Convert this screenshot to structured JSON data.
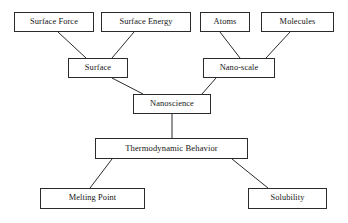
{
  "diagram": {
    "type": "hierarchy-tree",
    "background_color": "#ffffff",
    "box_border_color": "#2b2b2b",
    "text_color": "#161616",
    "connector_color": "#2b2b2b",
    "nodes": [
      {
        "id": "surface_force",
        "label": "Surface Force",
        "level": 1,
        "x": 14,
        "y": 12,
        "w": 80,
        "h": 20
      },
      {
        "id": "surface_energy",
        "label": "Surface Energy",
        "level": 1,
        "x": 101,
        "y": 12,
        "w": 90,
        "h": 20
      },
      {
        "id": "atoms",
        "label": "Atoms",
        "level": 1,
        "x": 200,
        "y": 12,
        "w": 50,
        "h": 20
      },
      {
        "id": "molecules",
        "label": "Molecules",
        "level": 1,
        "x": 261,
        "y": 12,
        "w": 73,
        "h": 20
      },
      {
        "id": "surface",
        "label": "Surface",
        "level": 2,
        "x": 68,
        "y": 58,
        "w": 60,
        "h": 20
      },
      {
        "id": "nano_scale",
        "label": "Nano-scale",
        "level": 2,
        "x": 203,
        "y": 58,
        "w": 72,
        "h": 20
      },
      {
        "id": "nanoscience",
        "label": "Nanoscience",
        "level": 3,
        "x": 133,
        "y": 94,
        "w": 78,
        "h": 20
      },
      {
        "id": "thermodynamic",
        "label": "Thermodynamic Behavior",
        "level": 4,
        "x": 95,
        "y": 138,
        "w": 153,
        "h": 21
      },
      {
        "id": "melting_point",
        "label": "Melting Point",
        "level": 5,
        "x": 40,
        "y": 188,
        "w": 105,
        "h": 21
      },
      {
        "id": "solubility",
        "label": "Solubility",
        "level": 5,
        "x": 248,
        "y": 188,
        "w": 79,
        "h": 21
      }
    ],
    "edges": [
      {
        "from": "surface_force",
        "to": "surface",
        "x1": 58,
        "y1": 32,
        "x2": 86,
        "y2": 58
      },
      {
        "from": "surface_energy",
        "to": "surface",
        "x1": 134,
        "y1": 32,
        "x2": 112,
        "y2": 58
      },
      {
        "from": "atoms",
        "to": "nano_scale",
        "x1": 220,
        "y1": 32,
        "x2": 240,
        "y2": 58
      },
      {
        "from": "molecules",
        "to": "nano_scale",
        "x1": 290,
        "y1": 32,
        "x2": 266,
        "y2": 58
      },
      {
        "from": "surface",
        "to": "nanoscience",
        "x1": 112,
        "y1": 78,
        "x2": 143,
        "y2": 94
      },
      {
        "from": "nano_scale",
        "to": "nanoscience",
        "x1": 216,
        "y1": 78,
        "x2": 202,
        "y2": 94
      },
      {
        "from": "nanoscience",
        "to": "thermodynamic",
        "x1": 172,
        "y1": 114,
        "x2": 172,
        "y2": 138
      },
      {
        "from": "thermodynamic",
        "to": "melting_point",
        "x1": 112,
        "y1": 159,
        "x2": 90,
        "y2": 188
      },
      {
        "from": "thermodynamic",
        "to": "solubility",
        "x1": 232,
        "y1": 159,
        "x2": 268,
        "y2": 188
      }
    ]
  }
}
